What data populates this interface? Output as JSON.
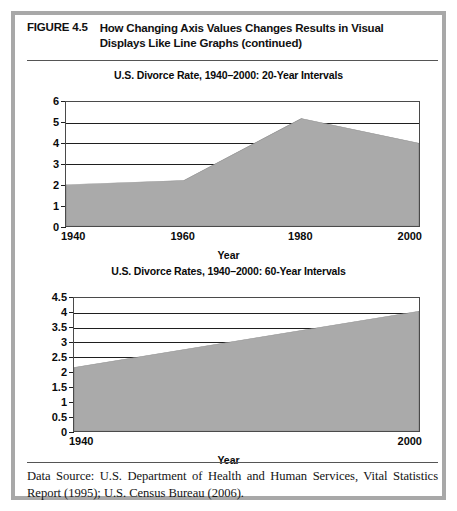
{
  "figure": {
    "number": "FIGURE 4.5",
    "caption_line1": "How Changing Axis Values Changes Results in Visual",
    "caption_line2": "Displays Like Line Graphs (continued)",
    "source_note": "Data Source: U.S. Department of Health and Human Services, Vital Statistics Report (1995); U.S. Census Bureau (2006)."
  },
  "style": {
    "frame_color": "#a8a8a8",
    "area_fill": "#aaaaaa",
    "axis_color": "#1f1f1f",
    "text_color": "#0a0a0a"
  },
  "chart_data": [
    {
      "id": "chart-1",
      "type": "area",
      "title": "U.S. Divorce Rate, 1940–2000: 20-Year Intervals",
      "xlabel": "Year",
      "ylabel": "",
      "x": [
        1940,
        1960,
        1980,
        2000
      ],
      "values": [
        2.0,
        2.2,
        5.2,
        4.0
      ],
      "xlim": [
        1940,
        2000
      ],
      "ylim": [
        0,
        6
      ],
      "yticks": [
        0,
        1,
        2,
        3,
        4,
        5,
        6
      ],
      "ytick_labels": [
        "0",
        "1",
        "2",
        "3",
        "4",
        "5",
        "6"
      ],
      "xticks": [
        1940,
        1960,
        1980,
        2000
      ],
      "xtick_labels": [
        "1940",
        "1960",
        "1980",
        "2000"
      ],
      "gridlines": [
        3,
        4,
        5
      ],
      "grid": true,
      "legend": "none"
    },
    {
      "id": "chart-2",
      "type": "area",
      "title": "U.S. Divorce Rates, 1940–2000: 60-Year Intervals",
      "xlabel": "Year",
      "ylabel": "",
      "x": [
        1940,
        2000
      ],
      "values": [
        2.15,
        4.05
      ],
      "xlim": [
        1940,
        2000
      ],
      "ylim": [
        0,
        4.5
      ],
      "yticks": [
        0,
        0.5,
        1,
        1.5,
        2,
        2.5,
        3,
        3.5,
        4,
        4.5
      ],
      "ytick_labels": [
        "0",
        "0.5",
        "1",
        "1.5",
        "2",
        "2.5",
        "3",
        "3.5",
        "4",
        "4.5"
      ],
      "xticks": [
        1940,
        2000
      ],
      "xtick_labels": [
        "1940",
        "2000"
      ],
      "gridlines": [
        2.5,
        3,
        3.5,
        4
      ],
      "grid": true,
      "legend": "none"
    }
  ]
}
